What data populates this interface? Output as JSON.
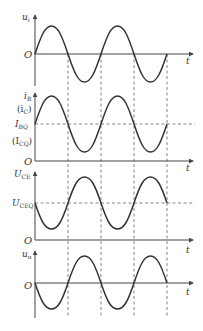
{
  "diagram": {
    "type": "waveform-timing-diagram",
    "x_axis_label": "t",
    "origin_label": "O",
    "panels": [
      {
        "id": "input-voltage",
        "y_label": "u",
        "y_label_sub": "i",
        "extra_labels": [],
        "waveform": "sine",
        "phase": "0"
      },
      {
        "id": "base-current",
        "y_label": "i",
        "y_label_sub": "B",
        "alt_label": "(i",
        "alt_label_sub": "C",
        "alt_label_close": ")",
        "quiescent_label": "I",
        "quiescent_sub": "BQ",
        "quiescent_alt": "(I",
        "quiescent_alt_sub": "CQ",
        "quiescent_alt_close": ")",
        "waveform": "sine+dc",
        "phase": "0"
      },
      {
        "id": "collector-emitter-voltage",
        "y_label": "U",
        "y_label_sub": "CE",
        "quiescent_label": "U",
        "quiescent_sub": "CEQ",
        "waveform": "sine+dc",
        "phase": "180"
      },
      {
        "id": "output-voltage",
        "y_label": "u",
        "y_label_sub": "o",
        "waveform": "sine",
        "phase": "180"
      }
    ],
    "colors": {
      "curve": "#333333",
      "axis": "#444444",
      "dashed": "#666666"
    }
  }
}
